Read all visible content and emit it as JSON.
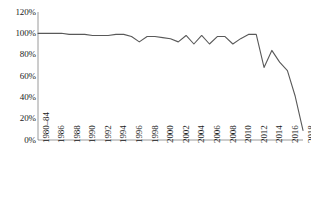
{
  "chart_data": {
    "type": "line",
    "title": "",
    "subtitle": "",
    "xlabel": "",
    "ylabel": "",
    "ylim": [
      0,
      120
    ],
    "yticks": [
      0,
      20,
      40,
      60,
      80,
      100,
      120
    ],
    "ytick_labels": [
      "0%",
      "20%",
      "40%",
      "60%",
      "80%",
      "100%",
      "120%"
    ],
    "grid": false,
    "legend": false,
    "legend_position": "none",
    "line_color": "#595959",
    "categories": [
      "1980–84",
      "1985",
      "1986",
      "1987",
      "1988",
      "1989",
      "1990",
      "1991",
      "1992",
      "1993",
      "1994",
      "1995",
      "1996",
      "1997",
      "1998",
      "1999",
      "2000",
      "2001",
      "2002",
      "2003",
      "2004",
      "2005",
      "2006",
      "2007",
      "2008",
      "2009",
      "2010",
      "2011",
      "2012",
      "2013",
      "2014",
      "2015",
      "2016",
      "2017",
      "2018"
    ],
    "xtick_labels": [
      "1980–84",
      "1986",
      "1988",
      "1990",
      "1992",
      "1994",
      "1996",
      "1998",
      "2000",
      "2002",
      "2004",
      "2006",
      "2008",
      "2010",
      "2012",
      "2014",
      "2016",
      "2018"
    ],
    "values": [
      100,
      100,
      100,
      100,
      99,
      99,
      99,
      98,
      98,
      98,
      99,
      99,
      97,
      92,
      97,
      97,
      96,
      95,
      92,
      98,
      90,
      98,
      90,
      97,
      97,
      90,
      95,
      99,
      99,
      68,
      84,
      73,
      65,
      41,
      9
    ],
    "series": [
      {
        "name": "series-1",
        "values": [
          100,
          100,
          100,
          100,
          99,
          99,
          99,
          98,
          98,
          98,
          99,
          99,
          97,
          92,
          97,
          97,
          96,
          95,
          92,
          98,
          90,
          98,
          90,
          97,
          97,
          90,
          95,
          99,
          99,
          68,
          84,
          73,
          65,
          41,
          9
        ]
      }
    ]
  }
}
